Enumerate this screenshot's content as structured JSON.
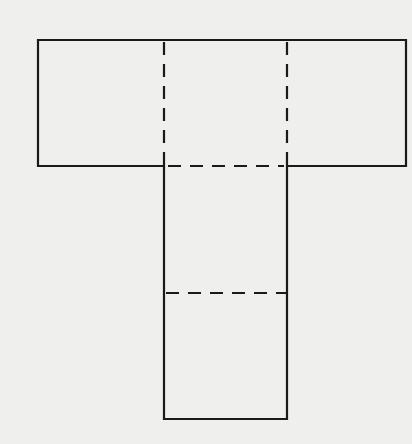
{
  "diagram": {
    "type": "net",
    "colors": {
      "background": "#efefed",
      "line": "#1a1a1a"
    },
    "faces": [
      {
        "id": "top-left",
        "x": 38,
        "y": 40,
        "w": 126,
        "h": 126
      },
      {
        "id": "top-middle",
        "x": 164,
        "y": 40,
        "w": 123,
        "h": 126
      },
      {
        "id": "top-right",
        "x": 287,
        "y": 40,
        "w": 119,
        "h": 126
      },
      {
        "id": "stem-upper",
        "x": 164,
        "y": 166,
        "w": 123,
        "h": 127
      },
      {
        "id": "stem-lower",
        "x": 164,
        "y": 293,
        "w": 123,
        "h": 126
      }
    ],
    "fold_lines": [
      {
        "x1": 164,
        "y1": 40,
        "x2": 164,
        "y2": 166
      },
      {
        "x1": 287,
        "y1": 40,
        "x2": 287,
        "y2": 166
      },
      {
        "x1": 164,
        "y1": 166,
        "x2": 287,
        "y2": 166
      },
      {
        "x1": 164,
        "y1": 293,
        "x2": 287,
        "y2": 293
      }
    ]
  }
}
